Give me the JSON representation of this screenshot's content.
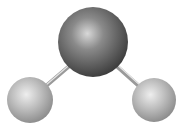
{
  "diagram": {
    "type": "ball-and-stick molecule",
    "molecule": "water (H2O)",
    "atoms": [
      {
        "id": "center",
        "element": "O",
        "cx": 93,
        "cy": 42,
        "r": 35,
        "color": "#6e6e6e",
        "highlight": "#d8d8d8",
        "shadow": "#3a3a3a"
      },
      {
        "id": "left",
        "element": "H",
        "cx": 30,
        "cy": 100,
        "r": 23,
        "color": "#b8b8b8",
        "highlight": "#eeeeee",
        "shadow": "#8a8a8a"
      },
      {
        "id": "right",
        "element": "H",
        "cx": 154,
        "cy": 100,
        "r": 22,
        "color": "#b8b8b8",
        "highlight": "#eeeeee",
        "shadow": "#8a8a8a"
      }
    ],
    "bonds": [
      {
        "id": "bond-left",
        "x1": 46,
        "y1": 86,
        "x2": 74,
        "y2": 62,
        "color": "#9a9a9a"
      },
      {
        "id": "bond-right",
        "x1": 112,
        "y1": 62,
        "x2": 140,
        "y2": 87,
        "color": "#9a9a9a"
      }
    ]
  }
}
